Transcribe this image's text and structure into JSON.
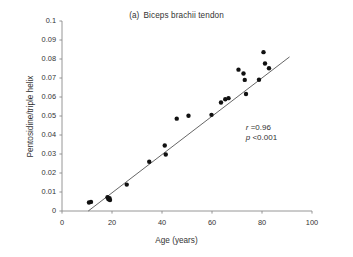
{
  "chart_data": {
    "type": "scatter",
    "panel_letter": "(a)",
    "panel_title": "Biceps brachii tendon",
    "xlabel": "Age (years)",
    "ylabel": "Pentosidine/triple helix",
    "xlim": [
      0,
      100
    ],
    "ylim": [
      0,
      0.1
    ],
    "xticks": [
      0,
      20,
      40,
      60,
      80,
      100
    ],
    "xtick_labels": [
      "0",
      "20",
      "40",
      "60",
      "80",
      "100"
    ],
    "yticks": [
      0,
      0.01,
      0.02,
      0.03,
      0.04,
      0.05,
      0.06,
      0.07,
      0.08,
      0.09,
      0.1
    ],
    "ytick_labels": [
      "0",
      "0.01",
      "0.02",
      "0.03",
      "0.04",
      "0.05",
      "0.06",
      "0.07",
      "0.08",
      "0.09",
      "0.1"
    ],
    "grid": false,
    "legend": null,
    "marker_color": "#111111",
    "line_color": "#555555",
    "axis_color": "#8a8a8a",
    "points": [
      {
        "x": 10.8,
        "y": 0.0045
      },
      {
        "x": 11.6,
        "y": 0.0048
      },
      {
        "x": 18.2,
        "y": 0.0072
      },
      {
        "x": 18.6,
        "y": 0.0062
      },
      {
        "x": 19.0,
        "y": 0.0068
      },
      {
        "x": 19.2,
        "y": 0.0058
      },
      {
        "x": 25.9,
        "y": 0.0139
      },
      {
        "x": 34.9,
        "y": 0.0259
      },
      {
        "x": 41.1,
        "y": 0.0345
      },
      {
        "x": 41.5,
        "y": 0.0297
      },
      {
        "x": 45.9,
        "y": 0.0486
      },
      {
        "x": 50.6,
        "y": 0.0501
      },
      {
        "x": 59.8,
        "y": 0.0506
      },
      {
        "x": 63.6,
        "y": 0.0571
      },
      {
        "x": 65.3,
        "y": 0.0588
      },
      {
        "x": 66.6,
        "y": 0.0594
      },
      {
        "x": 70.6,
        "y": 0.0744
      },
      {
        "x": 72.6,
        "y": 0.0724
      },
      {
        "x": 73.1,
        "y": 0.069
      },
      {
        "x": 73.6,
        "y": 0.0616
      },
      {
        "x": 78.8,
        "y": 0.0691
      },
      {
        "x": 80.6,
        "y": 0.0836
      },
      {
        "x": 81.2,
        "y": 0.0776
      },
      {
        "x": 82.8,
        "y": 0.0751
      }
    ],
    "fit_line": {
      "x0": 10.5,
      "y0": 0.0,
      "x1": 91.0,
      "y1": 0.0811
    },
    "annotations": [
      {
        "id": "r-value",
        "symbol": "r",
        "text": " =0.96",
        "x": 73.5,
        "y": 0.0435
      },
      {
        "id": "p-value",
        "symbol": "p",
        "text": " <0.001",
        "x": 73.5,
        "y": 0.0382
      }
    ]
  }
}
